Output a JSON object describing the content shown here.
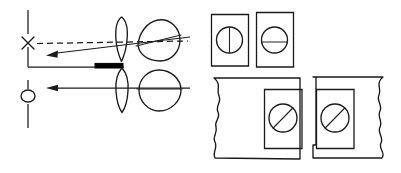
{
  "figure": {
    "canvas": {
      "width": 401,
      "height": 173,
      "background": "#ffffff"
    },
    "ink_color": "#1a1a1a",
    "panels": [
      {
        "name": "ray-optics-panel",
        "role": "left-diagram"
      },
      {
        "name": "panel-grid",
        "role": "right-diagram"
      }
    ]
  },
  "left_diagram": {
    "name": "ray-optics-panel",
    "optical_axis": {
      "name": "optical-axis",
      "x": 28,
      "segments": [
        {
          "y1": 10,
          "y2": 34
        },
        {
          "y1": 46,
          "y2": 68
        },
        {
          "y1": 80,
          "y2": 92
        },
        {
          "y1": 104,
          "y2": 128
        }
      ]
    },
    "markers": [
      {
        "name": "object-marker-cross",
        "glyph": "x-cross",
        "cx": 28,
        "cy": 43,
        "size": 9
      },
      {
        "name": "object-marker-circle",
        "glyph": "open-circle",
        "cx": 28,
        "cy": 96,
        "rx": 7,
        "ry": 6
      }
    ],
    "rays": [
      {
        "name": "dashed-virtual-ray",
        "style": "dashed",
        "x1": 36,
        "y1": 43,
        "x2": 186,
        "y2": 41,
        "arrow": false
      },
      {
        "name": "upper-chief-ray",
        "style": "solid",
        "x1": 186,
        "y1": 38,
        "x2": 48,
        "y2": 54,
        "arrow": true,
        "arrow_at": "left"
      },
      {
        "name": "optical-bench-line",
        "style": "solid",
        "x1": 28,
        "y1": 67,
        "x2": 124,
        "y2": 67,
        "arrow": false
      },
      {
        "name": "lower-axial-ray",
        "style": "solid",
        "x1": 186,
        "y1": 88,
        "x2": 48,
        "y2": 88,
        "arrow": true,
        "arrow_at": "left"
      }
    ],
    "solid_bar": {
      "name": "opaque-screen-bar",
      "x": 95,
      "y": 63.5,
      "width": 28,
      "height": 4.5,
      "color": "#000000"
    },
    "lenses": [
      {
        "name": "upper-lens",
        "shape": "tapered-lens",
        "cx": 121,
        "cy": 39,
        "rx": 6.5,
        "ry": 23
      },
      {
        "name": "lower-lens",
        "shape": "lens",
        "cx": 122,
        "cy": 90,
        "rx": 6.5,
        "ry": 22
      }
    ],
    "eyes": [
      {
        "name": "upper-eye",
        "cx": 158,
        "cy": 40,
        "r": 21,
        "has_equator_line": true,
        "tilted": true
      },
      {
        "name": "lower-eye",
        "cx": 159,
        "cy": 91,
        "r": 21,
        "has_equator_line": true,
        "tilted": false
      }
    ]
  },
  "right_diagram": {
    "name": "panel-grid",
    "top_cards": [
      {
        "name": "card-vertical-slit",
        "x": 211,
        "y": 14,
        "width": 37,
        "height": 52,
        "disc": {
          "name": "disc-vertical-line",
          "cx": 229.5,
          "cy": 40,
          "r": 13,
          "line_orientation": "vertical"
        }
      },
      {
        "name": "card-horizontal-slit",
        "x": 256,
        "y": 12,
        "width": 37,
        "height": 55,
        "disc": {
          "name": "disc-horizontal-line",
          "cx": 274.5,
          "cy": 40,
          "r": 13,
          "line_orientation": "horizontal"
        }
      }
    ],
    "bottom_panels": [
      {
        "name": "left-torn-panel",
        "wavy_edge": "left",
        "x": 214,
        "y": 77,
        "width": 86,
        "height": 84,
        "inner_card": {
          "name": "inner-card-left",
          "x": 264,
          "y": 89,
          "width": 38,
          "height": 60,
          "disc": {
            "name": "disc-diagonal-line-left",
            "cx": 283,
            "cy": 118,
            "r": 14,
            "line_orientation": "diagonal"
          }
        }
      },
      {
        "name": "right-torn-panel",
        "wavy_edge": "right",
        "x": 312,
        "y": 77,
        "width": 86,
        "height": 84,
        "inner_card": {
          "name": "inner-card-right",
          "x": 316,
          "y": 89,
          "width": 38,
          "height": 60,
          "disc": {
            "name": "disc-diagonal-line-right",
            "cx": 335,
            "cy": 118,
            "r": 14,
            "line_orientation": "diagonal"
          }
        }
      }
    ]
  }
}
